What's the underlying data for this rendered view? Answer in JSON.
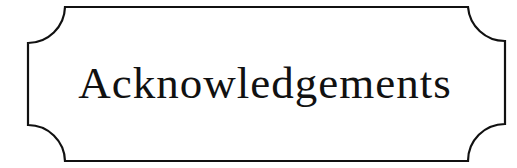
{
  "plaque": {
    "title": "Acknowledgements",
    "border_color": "#111111",
    "background_color": "#ffffff"
  }
}
